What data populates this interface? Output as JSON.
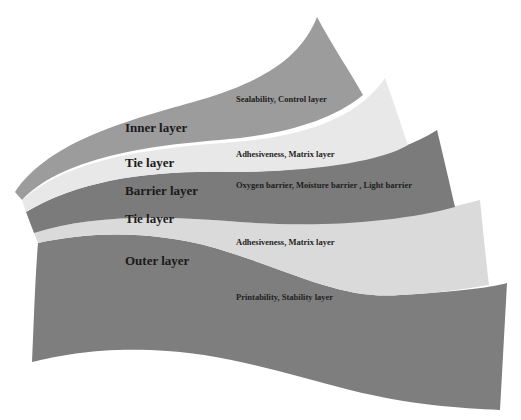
{
  "diagram": {
    "type": "multilayer-film-structure",
    "colors": {
      "inner": "#9c9c9c",
      "tie_upper": "#e8e8e8",
      "barrier": "#7b7b7b",
      "tie_lower": "#dadada",
      "outer": "#7e7e7e",
      "text": "#1a1a1a",
      "background": "#ffffff"
    },
    "layers": [
      {
        "id": "inner",
        "title": "Inner layer",
        "description": "Sealability, Control layer"
      },
      {
        "id": "tie_upper",
        "title": "Tie layer",
        "description": "Adhesiveness, Matrix layer"
      },
      {
        "id": "barrier",
        "title": "Barrier layer",
        "description": "Oxygen barrier, Moisture barrier , Light barrier"
      },
      {
        "id": "tie_lower",
        "title": "Tie layer",
        "description": "Adhesiveness, Matrix layer"
      },
      {
        "id": "outer",
        "title": "Outer layer",
        "description": "Printability, Stability layer"
      }
    ]
  }
}
